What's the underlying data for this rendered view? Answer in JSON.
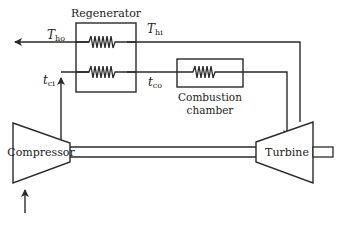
{
  "diagram": {
    "type": "gas-turbine-regenerative-cycle",
    "components": {
      "regenerator": {
        "label": "Regenerator"
      },
      "combustion_chamber": {
        "label_line1": "Combustion",
        "label_line2": "chamber"
      },
      "compressor": {
        "label": "Compressor"
      },
      "turbine": {
        "label": "Turbine"
      }
    },
    "labels": {
      "T_ho": {
        "main": "T",
        "sub": "ho"
      },
      "T_hi": {
        "main": "T",
        "sub": "hi"
      },
      "t_ci": {
        "main": "t",
        "sub": "ci"
      },
      "t_co": {
        "main": "t",
        "sub": "co"
      }
    },
    "colors": {
      "line": "#2a2a2a",
      "background": "#ffffff"
    }
  }
}
